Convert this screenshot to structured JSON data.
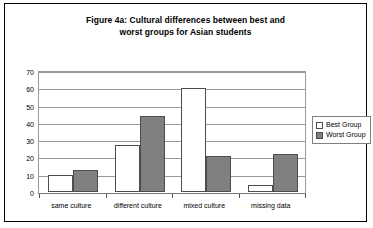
{
  "figure": {
    "title_line1": "Figure 4a: Cultural differences between best and",
    "title_line2": "worst groups for Asian students"
  },
  "legend": {
    "position": "right",
    "items": [
      {
        "label": "Best Group",
        "swatch": "white",
        "color": "#ffffff"
      },
      {
        "label": "Worst Group",
        "swatch": "gray",
        "color": "#808080"
      }
    ]
  },
  "axis": {
    "y_ticks": [
      "0",
      "10",
      "20",
      "30",
      "40",
      "50",
      "60",
      "70"
    ],
    "x_labels": [
      "same culture",
      "different culture",
      "mixed culture",
      "missing data"
    ]
  },
  "chart_data": {
    "type": "bar",
    "title": "Figure 4a: Cultural differences between best and worst groups for Asian students",
    "xlabel": "",
    "ylabel": "",
    "categories": [
      "same culture",
      "different culture",
      "mixed culture",
      "missing data"
    ],
    "series": [
      {
        "name": "Best Group",
        "color": "#ffffff",
        "values": [
          10,
          27,
          60,
          4
        ]
      },
      {
        "name": "Worst Group",
        "color": "#808080",
        "values": [
          13,
          44,
          21,
          22
        ]
      }
    ],
    "ylim": [
      0,
      70
    ],
    "ytick_step": 10,
    "grid": true,
    "grid_axis": "y",
    "legend_position": "right"
  }
}
